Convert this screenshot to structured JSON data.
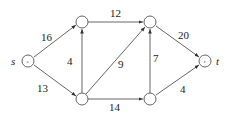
{
  "diagram": {
    "type": "flow-network",
    "nodes": [
      {
        "id": "s",
        "label": "s",
        "inner": "s",
        "x": 28,
        "y": 61
      },
      {
        "id": "v1",
        "label": "",
        "inner": "",
        "x": 82,
        "y": 22
      },
      {
        "id": "v2",
        "label": "",
        "inner": "",
        "x": 82,
        "y": 99
      },
      {
        "id": "v3",
        "label": "",
        "inner": "",
        "x": 150,
        "y": 22
      },
      {
        "id": "v4",
        "label": "",
        "inner": "",
        "x": 150,
        "y": 99
      },
      {
        "id": "t",
        "label": "t",
        "inner": "t",
        "x": 205,
        "y": 61
      }
    ],
    "edges": [
      {
        "from": "s",
        "to": "v1",
        "capacity": "16"
      },
      {
        "from": "s",
        "to": "v2",
        "capacity": "13"
      },
      {
        "from": "v2",
        "to": "v1",
        "capacity": "4"
      },
      {
        "from": "v1",
        "to": "v3",
        "capacity": "12"
      },
      {
        "from": "v2",
        "to": "v3",
        "capacity": "9"
      },
      {
        "from": "v2",
        "to": "v4",
        "capacity": "14"
      },
      {
        "from": "v4",
        "to": "v3",
        "capacity": "7"
      },
      {
        "from": "v3",
        "to": "t",
        "capacity": "20"
      },
      {
        "from": "v4",
        "to": "t",
        "capacity": "4"
      }
    ],
    "colors": {
      "stroke": "#555555",
      "text": "#222222",
      "background": "#ffffff"
    }
  }
}
